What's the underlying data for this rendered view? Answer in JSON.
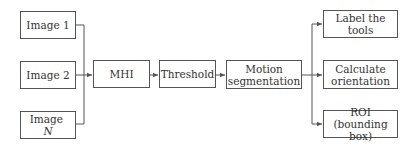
{
  "diagram": {
    "inputs": [
      {
        "label": "Image 1",
        "suffix": ""
      },
      {
        "label": "Image 2",
        "suffix": ""
      },
      {
        "label": "Image ",
        "suffix": "N"
      }
    ],
    "pipeline": [
      {
        "label": "MHI"
      },
      {
        "label": "Threshold"
      },
      {
        "line1": "Motion",
        "line2": "segmentation"
      }
    ],
    "outputs": [
      {
        "line1": "Label the tools",
        "line2": ""
      },
      {
        "line1": "Calculate",
        "line2": "orientation"
      },
      {
        "line1": "ROI (bounding",
        "line2": "box)"
      }
    ],
    "colors": {
      "stroke": "#555555",
      "text": "#333333",
      "background": "#ffffff"
    }
  }
}
